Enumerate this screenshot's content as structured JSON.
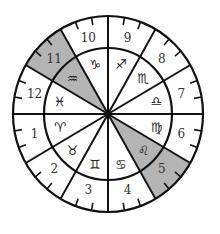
{
  "diagram": {
    "type": "zodiac-house-wheel",
    "center": {
      "x": 108,
      "y": 114
    },
    "outer_radius": {
      "rx": 95,
      "ry": 98
    },
    "inner_radius": {
      "rx": 64,
      "ry": 66
    },
    "colors": {
      "line": "#111111",
      "shade": "#b4b4b4",
      "background": "#ffffff",
      "text": "#333333"
    },
    "ticks_per_house": 2,
    "houses": [
      {
        "number": "1",
        "sign": "Aries",
        "glyph": "♈",
        "shaded": false
      },
      {
        "number": "2",
        "sign": "Taurus",
        "glyph": "♉",
        "shaded": false
      },
      {
        "number": "3",
        "sign": "Gemini",
        "glyph": "♊",
        "shaded": false
      },
      {
        "number": "4",
        "sign": "Cancer",
        "glyph": "♋",
        "shaded": false
      },
      {
        "number": "5",
        "sign": "Leo",
        "glyph": "♌",
        "shaded": true
      },
      {
        "number": "6",
        "sign": "Virgo",
        "glyph": "♍",
        "shaded": false
      },
      {
        "number": "7",
        "sign": "Libra",
        "glyph": "♎",
        "shaded": false
      },
      {
        "number": "8",
        "sign": "Scorpio",
        "glyph": "♏",
        "shaded": false
      },
      {
        "number": "9",
        "sign": "Sagittarius",
        "glyph": "♐",
        "shaded": false
      },
      {
        "number": "10",
        "sign": "Capricorn",
        "glyph": "♑",
        "shaded": false
      },
      {
        "number": "11",
        "sign": "Aquarius",
        "glyph": "♒",
        "shaded": true
      },
      {
        "number": "12",
        "sign": "Pisces",
        "glyph": "♓",
        "shaded": false
      }
    ]
  }
}
